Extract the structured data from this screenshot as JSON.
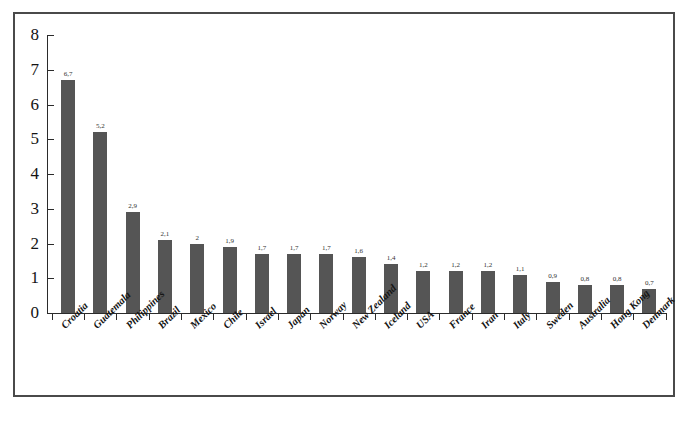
{
  "chart_data": {
    "type": "bar",
    "title": "",
    "xlabel": "",
    "ylabel": "",
    "ylim": [
      0,
      8
    ],
    "ytick_labels": [
      "8",
      "7",
      "6",
      "5",
      "4",
      "3",
      "2",
      "1",
      "0"
    ],
    "ytick_values": [
      8,
      7,
      6,
      5,
      4,
      3,
      2,
      1,
      0
    ],
    "grid": false,
    "legend": false,
    "decimal_separator": ",",
    "categories": [
      "Croatia",
      "Guatemala",
      "Philippines",
      "Brazil",
      "Mexico",
      "Chile",
      "Israel",
      "Japan",
      "Norway",
      "New Zealand",
      "Iceland",
      "USA",
      "France",
      "Iran",
      "Italy",
      "Sweden",
      "Australia",
      "Hong Kong",
      "Denmark"
    ],
    "values": [
      6.7,
      5.2,
      2.9,
      2.1,
      2.0,
      1.9,
      1.7,
      1.7,
      1.7,
      1.6,
      1.4,
      1.2,
      1.2,
      1.2,
      1.1,
      0.9,
      0.8,
      0.8,
      0.7
    ],
    "data_labels": [
      "6,7",
      "5,2",
      "2,9",
      "2,1",
      "2",
      "1,9",
      "1,7",
      "1,7",
      "1,7",
      "1,6",
      "1,4",
      "1,2",
      "1,2",
      "1,2",
      "1,1",
      "0,9",
      "0,8",
      "0,8",
      "0,7"
    ],
    "bar_color": "#555555",
    "axis_color": "#2b2b2b",
    "frame_color": "#4a4a4a"
  },
  "caption": {
    "text": ""
  }
}
